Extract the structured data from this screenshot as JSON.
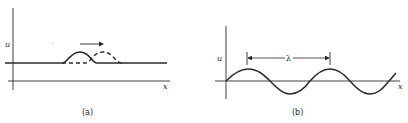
{
  "figure": {
    "panels": [
      {
        "id": "a",
        "caption": "(a)",
        "y_axis_label": "u",
        "x_axis_label": "x",
        "description": "Pulse (solid) translating to the right into a displaced pulse (dashed) along a baseline",
        "elements": {
          "baseline": "solid",
          "pulse_initial": "solid",
          "pulse_later": "dashed",
          "arrow_direction": "right"
        }
      },
      {
        "id": "b",
        "caption": "(b)",
        "y_axis_label": "u",
        "x_axis_label": "x",
        "description": "Sinusoidal wave with wavelength marked between two successive crests",
        "elements": {
          "wave": "sinusoid",
          "wavelength_marker_label": "λ"
        }
      }
    ],
    "colors": {
      "ink": "#2a2a2a",
      "background": "#ffffff"
    }
  }
}
